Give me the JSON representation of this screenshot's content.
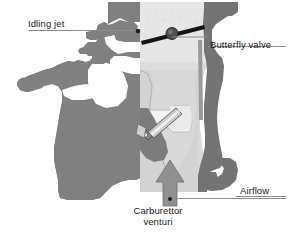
{
  "figure": {
    "type": "technical-cross-section",
    "background_color": "#ffffff"
  },
  "labels": {
    "idling_jet": "Idling jet",
    "butterfly_valve": "Butterfly valve",
    "airflow": "Airflow",
    "carburettor_venturi_line1": "Carburettor",
    "carburettor_venturi_line2": "venturi"
  },
  "colors": {
    "body_gray": "#808080",
    "casing_dark": "#737373",
    "throat_light": "#d9d9d9",
    "throat_lighter": "#e8e8e8",
    "leader_line": "#8a8a8a",
    "outline": "#4d4d4d",
    "valve_dark": "#1a1a1a",
    "nozzle_light": "#cfcfcf",
    "arrow_gray": "#909090",
    "text": "#1a1a1a"
  },
  "callouts": [
    {
      "name": "idling-jet",
      "label": "Idling jet",
      "text_anchor": "left",
      "leader_from": [
        30,
        30
      ],
      "leader_to": [
        138,
        31
      ],
      "marker": "dot"
    },
    {
      "name": "butterfly-valve",
      "label": "Butterfly valve",
      "text_anchor": "right",
      "leader_from": [
        208,
        37
      ],
      "leader_to": [
        172,
        37
      ],
      "marker": "line"
    },
    {
      "name": "airflow",
      "label": "Airflow",
      "text_anchor": "right",
      "leader_from": [
        286,
        197
      ],
      "leader_to": [
        172,
        197
      ],
      "marker": "line"
    },
    {
      "name": "carburettor-venturi",
      "label": "Carburettor venturi",
      "text_anchor": "center-bottom",
      "leader_from": [
        160,
        199
      ],
      "leader_to": [
        232,
        199
      ],
      "marker": "dot"
    }
  ],
  "components": [
    {
      "name": "carburettor-body",
      "description": "Cast body cross-section, mid gray"
    },
    {
      "name": "venturi-throat",
      "description": "Light gray vertical air passage"
    },
    {
      "name": "butterfly-valve-plate",
      "description": "Thin dark tilted disc across throat"
    },
    {
      "name": "butterfly-valve-spindle",
      "description": "Round pivot boss at centre of plate"
    },
    {
      "name": "idling-jet-passage",
      "description": "Small drilled passage at upper left"
    },
    {
      "name": "main-jet-nozzle",
      "description": "Diagonal cylindrical nozzle in throat"
    },
    {
      "name": "airflow-arrow",
      "description": "Upward gray arrow entering venturi"
    },
    {
      "name": "mounting-flange",
      "description": "Hooked flange on lower right casing"
    }
  ]
}
